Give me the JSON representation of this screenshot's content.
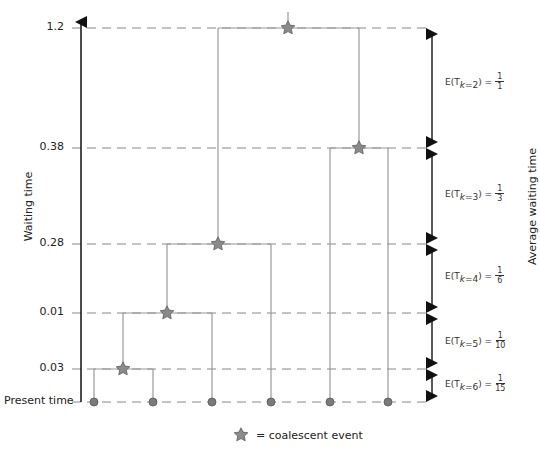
{
  "diagram": {
    "type": "coalescent-genealogy",
    "y_axis_label": "Waiting time",
    "right_axis_label": "Average waiting time",
    "y_levels": [
      {
        "label": "1.2",
        "y": 28
      },
      {
        "label": "0.38",
        "y": 148
      },
      {
        "label": "0.28",
        "y": 244
      },
      {
        "label": "0.01",
        "y": 313
      },
      {
        "label": "0.03",
        "y": 369
      },
      {
        "label": "Present time",
        "y": 402
      }
    ],
    "leaves_x": [
      94,
      153,
      212,
      271,
      330,
      388
    ],
    "expectations": [
      {
        "prefix": "E(T",
        "sub_var": "k",
        "sub_eq": "=2",
        "suffix": ") =",
        "num": "1",
        "den": "1"
      },
      {
        "prefix": "E(T",
        "sub_var": "k",
        "sub_eq": "=3",
        "suffix": ") =",
        "num": "1",
        "den": "3"
      },
      {
        "prefix": "E(T",
        "sub_var": "k",
        "sub_eq": "=4",
        "suffix": ") =",
        "num": "1",
        "den": "6"
      },
      {
        "prefix": "E(T",
        "sub_var": "k",
        "sub_eq": "=5",
        "suffix": ") =",
        "num": "1",
        "den": "10"
      },
      {
        "prefix": "E(T",
        "sub_var": "k",
        "sub_eq": "=6",
        "suffix": ") =",
        "num": "1",
        "den": "15"
      }
    ],
    "legend": {
      "icon": "star-icon",
      "text": "= coalescent event"
    },
    "colors": {
      "axis": "#111111",
      "branch": "#999999",
      "dash": "#888888",
      "node": "#7a7a7a",
      "star": "#8a8a8a"
    }
  }
}
